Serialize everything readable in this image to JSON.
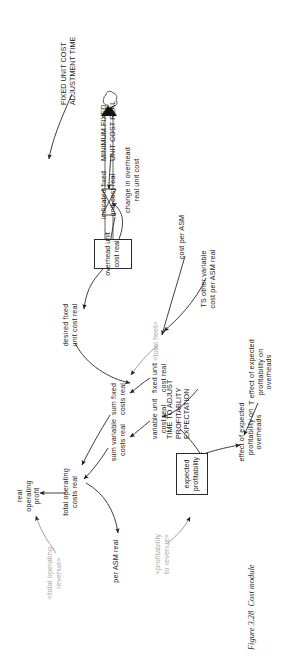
{
  "figure": {
    "caption_label": "Figure 3.28",
    "caption_text": "Cost module",
    "caption_full": "Figure 3.28  Cost module",
    "orientation": "rotated-90-ccw",
    "colors": {
      "ink": "#1c1c1c",
      "shadow_variable": "#a8a8a8",
      "page": "#ffffff",
      "stock_border": "#2a2a2a"
    }
  },
  "diagram": {
    "type": "stock-and-flow",
    "stocks": [
      {
        "id": "overhead-unit-cost-real",
        "label": "overhead unit\ncost real"
      },
      {
        "id": "expected-profitability",
        "label": "expected\nprofitability"
      }
    ],
    "flows": [
      {
        "id": "change-in-overhead-real-unit-cost",
        "label": "change in overhead\nreal unit cost",
        "from": "cloud",
        "to": "overhead-unit-cost-real"
      }
    ],
    "clouds": [
      {
        "id": "source-cloud"
      }
    ],
    "variables": [
      {
        "id": "real-operating-profit",
        "label": "real\noperating\nprofit"
      },
      {
        "id": "total-operating-costs-real",
        "label": "total operating\ncosts real"
      },
      {
        "id": "cost-per-asm",
        "label": "cost per ASM"
      },
      {
        "id": "per-asm-real",
        "label": "per ASM real"
      },
      {
        "id": "sum-variable-costs-real",
        "label": "sum variable\ncosts real"
      },
      {
        "id": "sum-fixed-costs-real",
        "label": "sum fixed\ncosts real"
      },
      {
        "id": "variable-unit-cost-real",
        "label": "variable unit\ncost real"
      },
      {
        "id": "fixed-unit-cost-real",
        "label": "fixed unit\ncost real"
      },
      {
        "id": "ts-other-variable-cost-per-asm-real",
        "label": "TS other variable\ncost per ASM real"
      },
      {
        "id": "desired-fixed-unit-cost-real",
        "label": "desired fixed\nunit cost real"
      },
      {
        "id": "indicated-fixed-unit-cost-real",
        "label": "indicated fixed\nunit cost real"
      },
      {
        "id": "effect-of-expected-profitability-on-overheads",
        "label": "effect of expected\nprofitability on\noverheads"
      },
      {
        "id": "t-effect-of-expected-profitability-on-overheads",
        "label": "T effect of expected\nprofitability on\noverheads"
      }
    ],
    "constants": [
      {
        "id": "time-to-adjust-profitablity-expectation",
        "label": "TIME TO ADJUST\nPROFITABLITY\nEXPECTATION"
      },
      {
        "id": "fixed-unit-cost-adjustment-time",
        "label": "FIXED UNIT COST\nADJUSTMENT TIME"
      },
      {
        "id": "minimum-fixed-unit-cost-real",
        "label": "MINIMUM FIXED\nUNIT COST REAL"
      }
    ],
    "shadow_variables": [
      {
        "id": "total-operating-revenue",
        "label": "<total operating\nrevenue>"
      },
      {
        "id": "profitability-to-revenue",
        "label": "<profitability\nto revenue>"
      },
      {
        "id": "total-fleet",
        "label": "<total fleet>"
      }
    ]
  }
}
